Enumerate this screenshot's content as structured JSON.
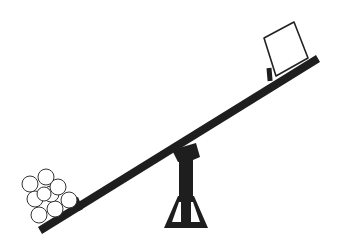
{
  "diagram": {
    "title": "Seesaw",
    "colors": {
      "ink": "#1e1e1e",
      "background": "#ffffff",
      "outline": "#222222"
    },
    "parts": {
      "plank": "plank",
      "fulcrum": "fulcrum",
      "left_load": "pile-of-balls",
      "right_load": "box",
      "ball_count": 9
    }
  }
}
